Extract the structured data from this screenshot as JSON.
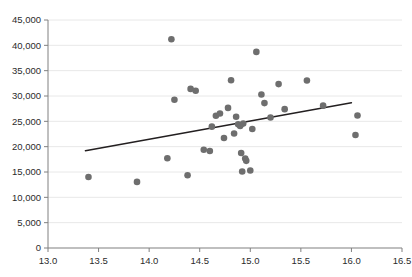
{
  "chart_data": {
    "type": "scatter",
    "title": "",
    "subtitle": "",
    "xlabel": "",
    "ylabel": "",
    "xlim": [
      13.0,
      16.5
    ],
    "ylim": [
      0,
      45000
    ],
    "xticks": [
      "13.0",
      "13.5",
      "14.0",
      "14.5",
      "15.0",
      "15.5",
      "16.0",
      "16.5"
    ],
    "xtick_values": [
      13.0,
      13.5,
      14.0,
      14.5,
      15.0,
      15.5,
      16.0,
      16.5
    ],
    "yticks": [
      "0",
      "5,000",
      "10,000",
      "15,000",
      "20,000",
      "25,000",
      "30,000",
      "35,000",
      "40,000",
      "45,000"
    ],
    "ytick_values": [
      0,
      5000,
      10000,
      15000,
      20000,
      25000,
      30000,
      35000,
      40000,
      45000
    ],
    "grid": "horizontal",
    "legend": "none",
    "marker_color": "#6e6e6e",
    "trendline_color": "#231f20",
    "gridline_color": "#e8e8e8",
    "axis_color": "#808080",
    "background_color": "#ffffff",
    "points": [
      {
        "x": 13.4,
        "y": 14000
      },
      {
        "x": 13.88,
        "y": 13050
      },
      {
        "x": 14.18,
        "y": 17700
      },
      {
        "x": 14.22,
        "y": 41200
      },
      {
        "x": 14.25,
        "y": 29250
      },
      {
        "x": 14.38,
        "y": 14350
      },
      {
        "x": 14.41,
        "y": 31400
      },
      {
        "x": 14.46,
        "y": 31050
      },
      {
        "x": 14.54,
        "y": 19400
      },
      {
        "x": 14.6,
        "y": 19150
      },
      {
        "x": 14.62,
        "y": 23950
      },
      {
        "x": 14.66,
        "y": 26100
      },
      {
        "x": 14.7,
        "y": 26550
      },
      {
        "x": 14.74,
        "y": 21700
      },
      {
        "x": 14.78,
        "y": 27650
      },
      {
        "x": 14.81,
        "y": 33100
      },
      {
        "x": 14.84,
        "y": 22600
      },
      {
        "x": 14.86,
        "y": 25900
      },
      {
        "x": 14.88,
        "y": 24400
      },
      {
        "x": 14.9,
        "y": 24100
      },
      {
        "x": 14.91,
        "y": 18750
      },
      {
        "x": 14.92,
        "y": 15100
      },
      {
        "x": 14.93,
        "y": 24550
      },
      {
        "x": 14.95,
        "y": 17650
      },
      {
        "x": 14.96,
        "y": 17200
      },
      {
        "x": 15.0,
        "y": 15300
      },
      {
        "x": 15.02,
        "y": 23500
      },
      {
        "x": 15.06,
        "y": 38700
      },
      {
        "x": 15.11,
        "y": 30300
      },
      {
        "x": 15.14,
        "y": 28600
      },
      {
        "x": 15.2,
        "y": 25750
      },
      {
        "x": 15.28,
        "y": 32350
      },
      {
        "x": 15.34,
        "y": 27400
      },
      {
        "x": 15.56,
        "y": 33050
      },
      {
        "x": 15.72,
        "y": 28100
      },
      {
        "x": 16.06,
        "y": 26150
      },
      {
        "x": 16.04,
        "y": 22300
      }
    ],
    "trendline": {
      "x0": 13.37,
      "y0": 19200,
      "x1": 16.0,
      "y1": 28650
    }
  }
}
